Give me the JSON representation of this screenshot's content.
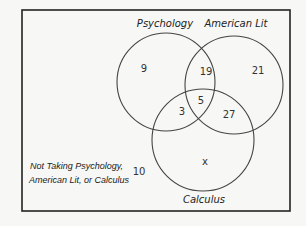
{
  "diagram": {
    "type": "venn",
    "sets": [
      {
        "name": "Psychology",
        "label": "Psychology"
      },
      {
        "name": "American Lit",
        "label": "American Lit"
      },
      {
        "name": "Calculus",
        "label": "Calculus"
      }
    ],
    "regions": {
      "psychology_only": "9",
      "american_lit_only": "21",
      "calculus_only": "x",
      "psychology_american_lit": "19",
      "psychology_calculus": "3",
      "american_lit_calculus": "27",
      "all_three": "5",
      "none": "10"
    },
    "outside_label_line1": "Not Taking Psychology,",
    "outside_label_line2": "American Lit, or Calculus"
  },
  "colors": {
    "stroke": "#444444",
    "border": "#222222",
    "background": "#f7f7f5"
  }
}
